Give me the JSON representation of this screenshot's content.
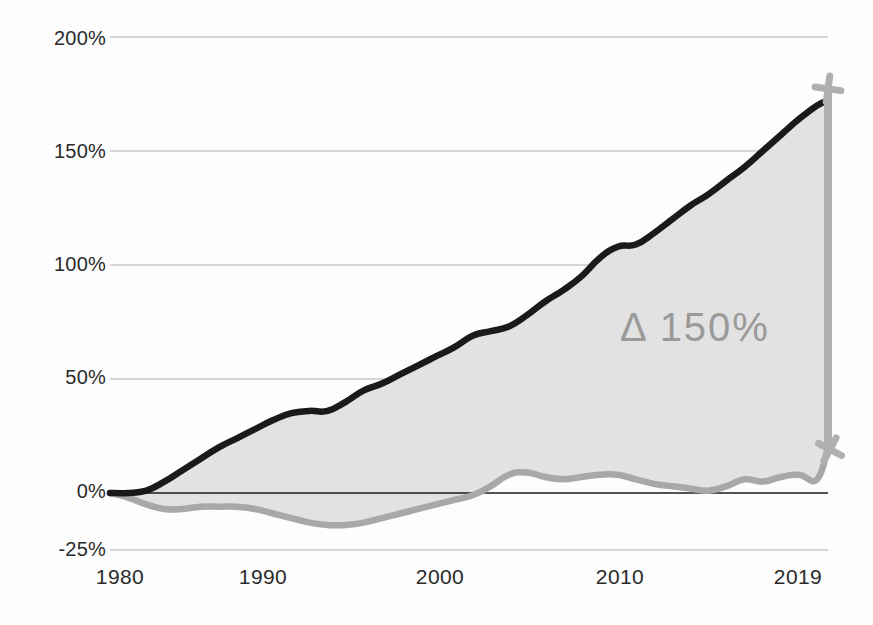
{
  "chart_data": {
    "type": "line",
    "title": "",
    "subtitle": "",
    "xlabel": "",
    "ylabel": "",
    "xlim": [
      1980,
      2019
    ],
    "ylim": [
      -25,
      200
    ],
    "grid": true,
    "legend_position": "none",
    "x_tick_labels": [
      "1980",
      "1990",
      "2000",
      "2010",
      "2019"
    ],
    "x_ticks": [
      1980,
      1990,
      2000,
      2010,
      2019
    ],
    "y_tick_labels": [
      "200%",
      "150%",
      "100%",
      "50%",
      "0%",
      "-25%"
    ],
    "y_ticks": [
      200,
      150,
      100,
      50,
      0,
      -25
    ],
    "annotations": [
      {
        "text": "Δ 150%",
        "x": 2011.5,
        "y": 76,
        "color": "#9a9a9a"
      }
    ],
    "colors": {
      "upper_series": "#1a1a1a",
      "lower_series": "#a8a8a8",
      "fill_between": "#e2e2e2",
      "gridline": "#c9c9c9",
      "zero_line": "#1a1a1a",
      "marker_bar": "#b0b0b0",
      "tick_text": "#2b2b2b"
    },
    "series": [
      {
        "name": "upper",
        "color": "#1a1a1a",
        "x": [
          1980,
          1981,
          1982,
          1983,
          1984,
          1985,
          1986,
          1987,
          1988,
          1989,
          1990,
          1991,
          1992,
          1993,
          1994,
          1995,
          1996,
          1997,
          1998,
          1999,
          2000,
          2001,
          2002,
          2003,
          2004,
          2005,
          2006,
          2007,
          2008,
          2009,
          2010,
          2011,
          2012,
          2013,
          2014,
          2015,
          2016,
          2017,
          2018,
          2019,
          2019.6
        ],
        "values": [
          0,
          0,
          1,
          5,
          10,
          15,
          20,
          24,
          28,
          32,
          35,
          36,
          36,
          40,
          45,
          48,
          52,
          56,
          60,
          64,
          69,
          71,
          73,
          78,
          84,
          89,
          95,
          103,
          108,
          109,
          114,
          120,
          126,
          131,
          137,
          143,
          150,
          157,
          164,
          170,
          172
        ]
      },
      {
        "name": "lower",
        "color": "#a8a8a8",
        "x": [
          1980,
          1981,
          1982,
          1983,
          1984,
          1985,
          1986,
          1987,
          1988,
          1989,
          1990,
          1991,
          1992,
          1993,
          1994,
          1995,
          1996,
          1997,
          1998,
          1999,
          2000,
          2001,
          2002,
          2003,
          2004,
          2005,
          2006,
          2007,
          2008,
          2009,
          2010,
          2011,
          2012,
          2013,
          2014,
          2015,
          2016,
          2017,
          2018,
          2019,
          2019.6
        ],
        "values": [
          0,
          -2,
          -5,
          -7,
          -7,
          -6,
          -6,
          -6,
          -7,
          -9,
          -11,
          -13,
          -14,
          -14,
          -13,
          -11,
          -9,
          -7,
          -5,
          -3,
          -1,
          3,
          8,
          9,
          7,
          6,
          7,
          8,
          8,
          6,
          4,
          3,
          2,
          1,
          3,
          6,
          5,
          7,
          8,
          6,
          20
        ]
      }
    ],
    "delta_marker": {
      "x": 2019.6,
      "y_top": 172,
      "y_bottom": 20,
      "label": "Δ 150%"
    }
  },
  "axis": {
    "y_labels": [
      {
        "text": "200%",
        "top": 27
      },
      {
        "text": "150%",
        "top": 140
      },
      {
        "text": "100%",
        "top": 253
      },
      {
        "text": "50%",
        "top": 366
      },
      {
        "text": "0%",
        "top": 480
      },
      {
        "text": "-25%",
        "top": 538
      }
    ],
    "x_labels": [
      {
        "text": "1980",
        "left": 120
      },
      {
        "text": "1990",
        "left": 263
      },
      {
        "text": "2000",
        "left": 440
      },
      {
        "text": "2010",
        "left": 620
      },
      {
        "text": "2019",
        "left": 798
      }
    ]
  },
  "annotation": {
    "text": "Δ 150%",
    "left": 620,
    "top": 305
  }
}
